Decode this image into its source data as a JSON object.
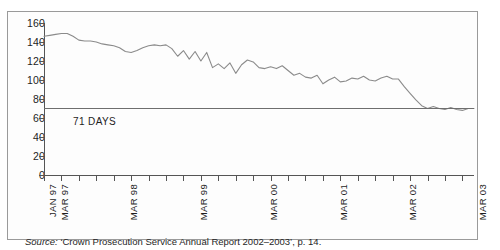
{
  "figure": {
    "source_prefix": "Source:",
    "source_text": " ‘Crown Prosecution Service Annual Report 2002–2003’, p. 14.",
    "border_color": "#9a9a9a",
    "line_color": "#8b8b8b",
    "refline_color": "#6e6e6e"
  },
  "chart_data": {
    "type": "line",
    "title": "",
    "subtitle": "",
    "xlabel": "",
    "ylabel": "",
    "ylim": [
      0,
      160
    ],
    "ytick_values": [
      0,
      20,
      40,
      60,
      80,
      100,
      120,
      140,
      160
    ],
    "ytick_labels": [
      "0",
      "20",
      "40",
      "60",
      "80",
      "100",
      "120",
      "140",
      "160"
    ],
    "grid": false,
    "legend": false,
    "units": "days",
    "x_start_label": "JAN 97",
    "x_end_label": "MAR 03",
    "xtick_labels": [
      "JAN 97",
      "MAR 97",
      "MAR 98",
      "MAR 99",
      "MAR 00",
      "MAR 01",
      "MAR 02",
      "MAR 03"
    ],
    "xtick_index": [
      0,
      2,
      14,
      26,
      38,
      50,
      62,
      74
    ],
    "minor_tick_every_months": 3,
    "n_points": 75,
    "annotations": [
      {
        "name": "71-days-reference",
        "label": "71 DAYS",
        "value": 71,
        "type": "horizontal-line"
      }
    ],
    "series": [
      {
        "name": "Average number of days",
        "values": [
          146,
          147,
          148,
          149,
          149,
          146,
          142,
          141,
          141,
          140,
          138,
          137,
          136,
          134,
          130,
          129,
          131,
          134,
          136,
          137,
          136,
          137,
          133,
          125,
          131,
          122,
          130,
          120,
          129,
          113,
          117,
          112,
          118,
          107,
          116,
          121,
          119,
          113,
          112,
          114,
          112,
          115,
          110,
          105,
          107,
          103,
          102,
          105,
          96,
          100,
          103,
          98,
          99,
          102,
          101,
          104,
          100,
          99,
          102,
          104,
          101,
          101,
          93,
          86,
          79,
          73,
          70,
          72,
          70,
          69,
          71,
          69,
          68,
          70,
          70
        ]
      }
    ]
  }
}
